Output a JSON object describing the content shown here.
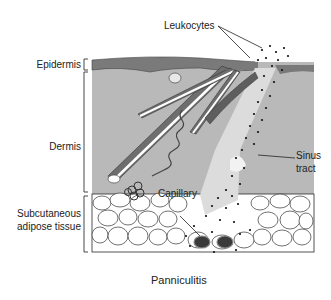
{
  "figure": {
    "title": "Panniculitis",
    "layers": [
      {
        "id": "epidermis",
        "label": "Epidermis"
      },
      {
        "id": "dermis",
        "label": "Dermis"
      },
      {
        "id": "subcutaneous",
        "label_line1": "Subcutaneous",
        "label_line2": "adipose tissue"
      }
    ],
    "annotations": {
      "leukocytes": "Leukocytes",
      "sinus_line1": "Sinus",
      "sinus_line2": "tract",
      "capillary": "Capillary"
    },
    "colors": {
      "epidermis": "#7a7a7a",
      "dermis": "#b9b9b9",
      "fat": "#ffffff",
      "sinus": "#dcdcdc",
      "capillary": "#3a3a3a",
      "follicle": "#6e6e6e",
      "outline": "#2a2a2a"
    }
  }
}
